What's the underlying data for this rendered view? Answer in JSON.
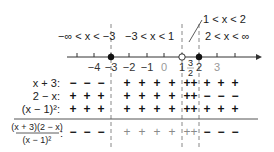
{
  "intervals": {
    "left": "−∞ < x < −3",
    "middle": "−3 < x < 1",
    "narrow": "1 < x < 2",
    "right": "2 < x < ∞"
  },
  "number_line": {
    "ticks": [
      {
        "label": "",
        "x": 77
      },
      {
        "label": "−4",
        "x": 94
      },
      {
        "label": "−3",
        "x": 111
      },
      {
        "label": "−2",
        "x": 129
      },
      {
        "label": "−1",
        "x": 147
      },
      {
        "label": "0",
        "x": 164
      },
      {
        "label": "1",
        "x": 182
      },
      {
        "label": "2",
        "x": 199
      },
      {
        "label": "3",
        "x": 217
      },
      {
        "label": "",
        "x": 235
      }
    ],
    "closed_points": [
      "−3",
      "2"
    ],
    "open_points": [
      "1"
    ],
    "test_point": {
      "numerator": "3",
      "denominator": "2"
    }
  },
  "rows": [
    {
      "label": "x + 3:",
      "left": [
        "−",
        "−",
        "−"
      ],
      "middle": [
        "+",
        "+",
        "+",
        "+"
      ],
      "narrow": "++",
      "right": [
        "+",
        "+",
        "+"
      ]
    },
    {
      "label": "2 − x:",
      "left": [
        "+",
        "+",
        "+"
      ],
      "middle": [
        "+",
        "+",
        "+",
        "+"
      ],
      "narrow": "++",
      "right": [
        "−",
        "−",
        "−"
      ]
    },
    {
      "label": "(x − 1)²:",
      "left": [
        "+",
        "+",
        "+"
      ],
      "middle": [
        "+",
        "+",
        "+",
        "+"
      ],
      "narrow": "++",
      "right": [
        "+",
        "+",
        "+"
      ]
    }
  ],
  "result_row": {
    "numerator": "(x + 3)(2 − x)",
    "denominator": "(x − 1)²",
    "colon": ":",
    "left": [
      "−",
      "−",
      "−"
    ],
    "middle": [
      "+",
      "+",
      "+",
      "+"
    ],
    "narrow": "++",
    "right": [
      "−",
      "−",
      "−"
    ]
  }
}
